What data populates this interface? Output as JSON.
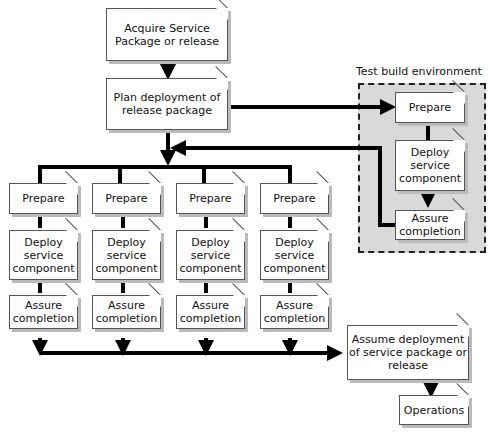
{
  "diagram": {
    "top": {
      "acquire": "Acquire Service Package or release",
      "plan": "Plan deployment of release package"
    },
    "test_env": {
      "label": "Test build environment",
      "prepare": "Prepare",
      "deploy": "Deploy service component",
      "assure": "Assure completion"
    },
    "columns": [
      {
        "prepare": "Prepare",
        "deploy": "Deploy service component",
        "assure": "Assure completion"
      },
      {
        "prepare": "Prepare",
        "deploy": "Deploy service component",
        "assure": "Assure completion"
      },
      {
        "prepare": "Prepare",
        "deploy": "Deploy service component",
        "assure": "Assure completion"
      },
      {
        "prepare": "Prepare",
        "deploy": "Deploy service component",
        "assure": "Assure completion"
      }
    ],
    "bottom": {
      "assume": "Assume deployment of service package or release",
      "operations": "Operations"
    }
  }
}
